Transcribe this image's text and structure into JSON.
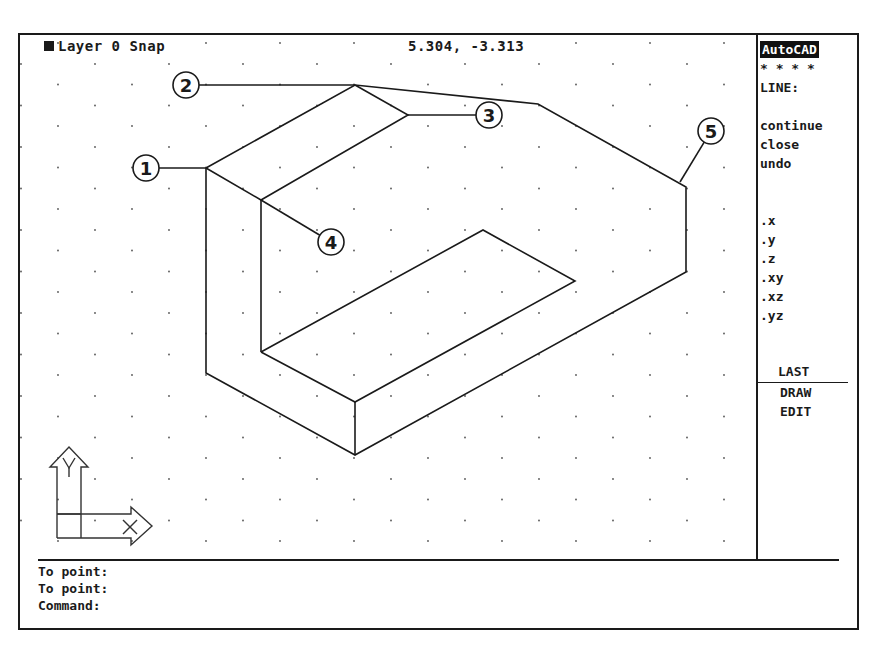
{
  "status_bar": {
    "layer_label": "Layer 0 Snap",
    "coordinates": "5.304, -3.313"
  },
  "side_menu": {
    "title": "AutoCAD",
    "stars": "* * * *",
    "command": "LINE:",
    "options": [
      "continue",
      "close",
      "undo"
    ],
    "filters": [
      ".x",
      ".y",
      ".z",
      ".xy",
      ".xz",
      ".yz"
    ],
    "nav": [
      "LAST",
      "DRAW",
      "EDIT"
    ]
  },
  "command_area": {
    "lines": [
      "To point:",
      "To point:",
      "Command:"
    ]
  },
  "drawing": {
    "callouts": [
      {
        "label": "1",
        "cx": 146,
        "cy": 168,
        "tx": 206,
        "ty": 168
      },
      {
        "label": "2",
        "cx": 186,
        "cy": 85,
        "tx": 355,
        "ty": 85
      },
      {
        "label": "3",
        "cx": 489,
        "cy": 115,
        "tx": 408,
        "ty": 115
      },
      {
        "label": "4",
        "cx": 331,
        "cy": 242,
        "tx": 261,
        "ty": 200
      },
      {
        "label": "5",
        "cx": 711,
        "cy": 131,
        "tx": 680,
        "ty": 182
      }
    ],
    "ucs_icon": {
      "x_label": "X",
      "y_label": "Y"
    }
  }
}
